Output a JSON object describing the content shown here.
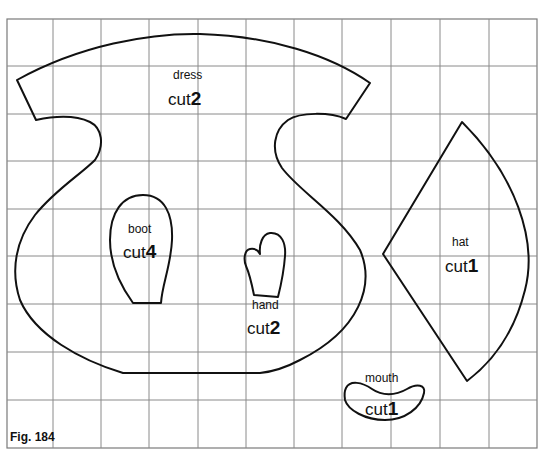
{
  "figure": {
    "label": "Fig. 184",
    "grid": {
      "columns": 11,
      "rows": 9,
      "line_color": "#8a8a8a"
    },
    "outline_color": "#111111"
  },
  "pieces": {
    "dress": {
      "name": "dress",
      "cut_word": "cut",
      "cut_count": "2"
    },
    "boot": {
      "name": "boot",
      "cut_word": "cut",
      "cut_count": "4"
    },
    "hand": {
      "name": "hand",
      "cut_word": "cut",
      "cut_count": "2"
    },
    "hat": {
      "name": "hat",
      "cut_word": "cut",
      "cut_count": "1"
    },
    "mouth": {
      "name": "mouth",
      "cut_word": "cut",
      "cut_count": "1"
    }
  }
}
